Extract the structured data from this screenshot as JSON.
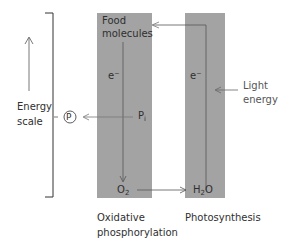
{
  "diagram": {
    "energy_axis": {
      "label_line1": "Energy",
      "label_line2": "scale"
    },
    "phosphate_product": "P",
    "columns": [
      {
        "name": "oxidative-phosphorylation",
        "caption_line1": "Oxidative",
        "caption_line2": "phosphorylation",
        "top_label_line1": "Food",
        "top_label_line2": "molecules",
        "electron_label": "e⁻",
        "input_label": "P",
        "input_subscript": "i",
        "bottom_label": "O",
        "bottom_subscript": "2"
      },
      {
        "name": "photosynthesis",
        "caption": "Photosynthesis",
        "electron_label": "e⁻",
        "bottom_label_main": "H",
        "bottom_subscript": "2",
        "bottom_label_tail": "O"
      }
    ],
    "light_input": {
      "line1": "Light",
      "line2": "energy"
    },
    "colors": {
      "column_fill": "#a3a3a3",
      "line": "#555555",
      "text": "#2f2f2f"
    }
  }
}
